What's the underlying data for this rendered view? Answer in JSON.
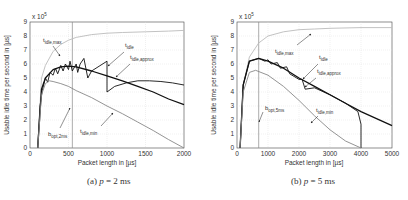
{
  "chart_data": [
    {
      "type": "line",
      "caption": "(a) p = 2 ms",
      "caption_label": "(a)",
      "caption_var": "p",
      "caption_value": "= 2 ms",
      "xlabel": "Packet length in [µs]",
      "ylabel": "Usable idle time per second in [µs]",
      "y_multiplier": "x 10^5",
      "xlim": [
        0,
        2000
      ],
      "ylim": [
        0,
        9
      ],
      "xticks": [
        0,
        500,
        1000,
        1500,
        2000
      ],
      "yticks": [
        0,
        1,
        2,
        3,
        4,
        5,
        6,
        7,
        8,
        9
      ],
      "grid": true,
      "vline": {
        "name": "b_opt,2ms",
        "x": 550
      },
      "series": [
        {
          "name": "t_idle,max",
          "color": "#bbbbbb",
          "x": [
            100,
            150,
            200,
            300,
            400,
            500,
            600,
            800,
            1000,
            1200,
            1500,
            1800,
            2000
          ],
          "values": [
            0,
            5.0,
            5.9,
            6.9,
            7.4,
            7.7,
            7.9,
            8.1,
            8.2,
            8.25,
            8.3,
            8.35,
            8.4
          ]
        },
        {
          "name": "t_idle",
          "color": "#111111",
          "x": [
            100,
            130,
            160,
            200,
            230,
            260,
            300,
            330,
            360,
            400,
            430,
            460,
            500,
            520,
            550,
            600,
            620,
            650,
            700,
            750,
            800,
            1000,
            1000,
            1100,
            1250,
            1400,
            1550,
            1700,
            1850,
            2000
          ],
          "values": [
            0,
            3.0,
            4.1,
            5.0,
            4.7,
            5.4,
            5.2,
            5.7,
            5.3,
            5.9,
            5.5,
            6.0,
            5.6,
            6.2,
            5.5,
            6.0,
            5.4,
            6.0,
            6.4,
            5.0,
            5.5,
            6.2,
            4.0,
            4.4,
            4.65,
            4.8,
            4.8,
            4.75,
            4.65,
            4.5
          ]
        },
        {
          "name": "t_idle,approx",
          "color": "#111111",
          "x": [
            100,
            150,
            200,
            300,
            400,
            500,
            600,
            800,
            1000,
            1200,
            1400,
            1600,
            1800,
            2000
          ],
          "values": [
            0,
            4.2,
            5.0,
            5.6,
            5.8,
            5.85,
            5.8,
            5.5,
            5.15,
            4.8,
            4.4,
            4.0,
            3.5,
            3.1
          ]
        },
        {
          "name": "t_idle,min",
          "color": "#888888",
          "x": [
            100,
            150,
            200,
            250,
            300,
            400,
            500,
            600,
            800,
            1000,
            1200,
            1400,
            1600,
            1800,
            2000
          ],
          "values": [
            0,
            3.8,
            4.6,
            4.8,
            4.75,
            4.6,
            4.4,
            4.1,
            3.6,
            3.0,
            2.45,
            1.85,
            1.25,
            0.6,
            0
          ]
        }
      ],
      "annotations": [
        "t_idle,max",
        "t_idle",
        "t_idle,approx",
        "t_idle,min",
        "b_opt,2ms"
      ]
    },
    {
      "type": "line",
      "caption": "(b) p = 5 ms",
      "caption_label": "(b)",
      "caption_var": "p",
      "caption_value": "= 5 ms",
      "xlabel": "Packet length in [µs]",
      "ylabel": "Usable idle time per second in [µs]",
      "y_multiplier": "x 10^5",
      "xlim": [
        0,
        5000
      ],
      "ylim": [
        0,
        9
      ],
      "xticks": [
        0,
        1000,
        2000,
        3000,
        4000,
        5000
      ],
      "yticks": [
        0,
        1,
        2,
        3,
        4,
        5,
        6,
        7,
        8,
        9
      ],
      "grid": true,
      "vline": {
        "name": "b_opt,5ms",
        "x": 700
      },
      "series": [
        {
          "name": "t_idle,max",
          "color": "#bbbbbb",
          "x": [
            100,
            200,
            400,
            700,
            1000,
            1500,
            2000,
            2500,
            3000,
            4000,
            5000
          ],
          "values": [
            0,
            4.5,
            6.5,
            7.5,
            8.0,
            8.3,
            8.45,
            8.5,
            8.55,
            8.6,
            8.6
          ]
        },
        {
          "name": "t_idle",
          "color": "#111111",
          "x": [
            100,
            200,
            400,
            700,
            900,
            1000,
            1100,
            1300,
            1400,
            1600,
            1700,
            2000,
            2100,
            2200,
            2500,
            3000,
            3500,
            3900,
            4000,
            4000
          ],
          "values": [
            0,
            4.5,
            6.2,
            6.4,
            6.2,
            6.3,
            6.0,
            6.1,
            5.7,
            5.8,
            5.3,
            4.9,
            4.9,
            4.2,
            4.3,
            3.8,
            3.2,
            2.6,
            1.7,
            0
          ]
        },
        {
          "name": "t_idle,approx",
          "color": "#111111",
          "x": [
            100,
            200,
            400,
            700,
            1000,
            1500,
            2000,
            2500,
            3000,
            3500,
            4000,
            4500,
            5000
          ],
          "values": [
            0,
            4.5,
            6.2,
            6.4,
            6.2,
            5.7,
            5.0,
            4.4,
            3.8,
            3.2,
            2.6,
            2.1,
            1.6
          ]
        },
        {
          "name": "t_idle,min",
          "color": "#888888",
          "x": [
            100,
            200,
            400,
            600,
            1000,
            1500,
            2000,
            2500,
            3000,
            3500,
            4000
          ],
          "values": [
            0,
            4.0,
            5.4,
            5.55,
            5.2,
            4.4,
            3.4,
            2.3,
            1.3,
            0.5,
            0
          ]
        }
      ],
      "annotations": [
        "t_idle,max",
        "t_idle",
        "t_idle,approx",
        "t_idle,min",
        "b_opt,5ms"
      ]
    }
  ],
  "labels": {
    "xlabel": "Packet length in [µs]",
    "ylabel": "Usable idle time per second in [µs]",
    "multiplier_base": "x 10",
    "multiplier_exp": "5",
    "t": "t",
    "b": "b",
    "sub_max": "idle,max",
    "sub_idle": "idle",
    "sub_approx": "idle,approx",
    "sub_min": "idle,min",
    "sub_opt2": "opt,2ms",
    "sub_opt5": "opt,5ms"
  },
  "captions": {
    "a_label": "(a)",
    "a_var": "p",
    "a_rest": "= 2 ms",
    "b_label": "(b)",
    "b_var": "p",
    "b_rest": "= 5 ms"
  },
  "ticks": {
    "y": [
      "0",
      "1",
      "2",
      "3",
      "4",
      "5",
      "6",
      "7",
      "8",
      "9"
    ],
    "xa": [
      "0",
      "500",
      "1000",
      "1500",
      "2000"
    ],
    "xb": [
      "0",
      "1000",
      "2000",
      "3000",
      "4000",
      "5000"
    ]
  }
}
